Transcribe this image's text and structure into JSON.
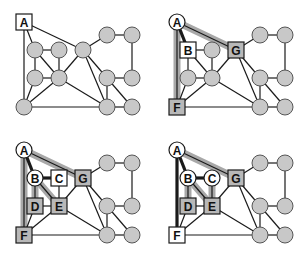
{
  "colors": {
    "background": "#ffffff",
    "edge": "#1a1a1a",
    "band": "#a8a8a8",
    "node_unvisited": "#c8c8c8",
    "node_frontier": "#b8b8b8",
    "node_current": "#ffffff",
    "node_visited": "#ffffff",
    "stroke": "#1a1a1a"
  },
  "panel_offsets": [
    [
      0,
      0
    ],
    [
      153,
      0
    ],
    [
      0,
      128
    ],
    [
      153,
      128
    ]
  ],
  "nodes": {
    "A": {
      "x": 24,
      "y": 22,
      "label": "A"
    },
    "B": {
      "x": 35,
      "y": 50,
      "label": "B"
    },
    "C": {
      "x": 59,
      "y": 50,
      "label": "C"
    },
    "G": {
      "x": 83,
      "y": 50,
      "label": "G"
    },
    "D": {
      "x": 35,
      "y": 78,
      "label": "D"
    },
    "E": {
      "x": 59,
      "y": 78,
      "label": "E"
    },
    "F": {
      "x": 24,
      "y": 107,
      "label": "F"
    },
    "R1": {
      "x": 107,
      "y": 35,
      "label": ""
    },
    "R2": {
      "x": 132,
      "y": 35,
      "label": ""
    },
    "R3": {
      "x": 107,
      "y": 78,
      "label": ""
    },
    "R4": {
      "x": 132,
      "y": 78,
      "label": ""
    },
    "R5": {
      "x": 107,
      "y": 107,
      "label": ""
    },
    "R6": {
      "x": 132,
      "y": 107,
      "label": ""
    }
  },
  "edges": [
    [
      "A",
      "F"
    ],
    [
      "A",
      "B"
    ],
    [
      "A",
      "G"
    ],
    [
      "B",
      "C"
    ],
    [
      "B",
      "D"
    ],
    [
      "B",
      "E"
    ],
    [
      "C",
      "E"
    ],
    [
      "D",
      "E"
    ],
    [
      "D",
      "F"
    ],
    [
      "E",
      "F"
    ],
    [
      "E",
      "G"
    ],
    [
      "E",
      "R5"
    ],
    [
      "G",
      "R1"
    ],
    [
      "G",
      "R3"
    ],
    [
      "G",
      "R5"
    ],
    [
      "F",
      "R5"
    ],
    [
      "R1",
      "R2"
    ],
    [
      "R2",
      "R4"
    ],
    [
      "R3",
      "R4"
    ],
    [
      "R3",
      "R5"
    ],
    [
      "R3",
      "R6"
    ],
    [
      "R5",
      "R6"
    ]
  ],
  "panels": [
    {
      "name": "step-1",
      "squares": {
        "A": "current"
      },
      "circles_labeled": {},
      "thick_edges": [],
      "bands": []
    },
    {
      "name": "step-2",
      "squares": {
        "B": "current",
        "G": "frontier",
        "F": "frontier"
      },
      "circles_labeled": {
        "A": "visited"
      },
      "thick_edges": [
        [
          "A",
          "B"
        ]
      ],
      "bands": [
        [
          "A",
          "G"
        ],
        [
          "A",
          "F"
        ]
      ]
    },
    {
      "name": "step-3",
      "squares": {
        "C": "current",
        "D": "frontier",
        "E": "frontier",
        "G": "frontier",
        "F": "frontier"
      },
      "circles_labeled": {
        "A": "visited",
        "B": "visited"
      },
      "thick_edges": [
        [
          "A",
          "B"
        ],
        [
          "B",
          "C"
        ]
      ],
      "bands": [
        [
          "A",
          "G"
        ],
        [
          "A",
          "F"
        ],
        [
          "B",
          "D"
        ],
        [
          "B",
          "E"
        ]
      ]
    },
    {
      "name": "step-4",
      "squares": {
        "F": "current",
        "D": "frontier",
        "E": "frontier",
        "G": "frontier"
      },
      "circles_labeled": {
        "A": "visited",
        "B": "visited",
        "C": "visited"
      },
      "thick_edges": [
        [
          "A",
          "B"
        ],
        [
          "B",
          "C"
        ],
        [
          "A",
          "F"
        ]
      ],
      "bands": [
        [
          "A",
          "G"
        ],
        [
          "B",
          "D"
        ],
        [
          "B",
          "E"
        ],
        [
          "C",
          "E"
        ]
      ]
    }
  ]
}
